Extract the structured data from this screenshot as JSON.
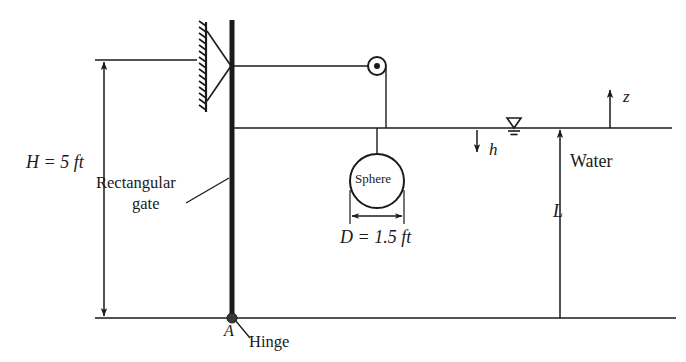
{
  "figure": {
    "background_color": "#ffffff",
    "line_color": "#1a1a1a"
  },
  "labels": {
    "height_dimension": "H = 5 ft",
    "gate_line1": "Rectangular",
    "gate_line2": "gate",
    "sphere": "Sphere",
    "diameter_dimension": "D = 1.5 ft",
    "depth_symbol": "h",
    "length_symbol": "L",
    "fluid": "Water",
    "vertical_axis": "z",
    "hinge_point": "A",
    "hinge_label": "Hinge"
  },
  "geometry": {
    "gate": {
      "x": 232,
      "y_top": 20,
      "y_bottom": 318,
      "thickness": 5
    },
    "pulley": {
      "cx": 377,
      "cy": 66,
      "radius": 9,
      "hub_radius": 3
    },
    "sphere": {
      "cx": 377,
      "cy": 181,
      "radius": 27
    },
    "water_surface_y": 128,
    "ground_y": 318,
    "top_reference_y": 60,
    "wall_support": {
      "x": 205,
      "y_top": 22,
      "y_bottom": 112
    },
    "h_arrow": {
      "x": 477,
      "y_from": 130,
      "y_to": 152
    },
    "L_arrow": {
      "x": 560,
      "y_from": 318,
      "y_to": 130
    },
    "z_arrow": {
      "x": 610,
      "y_from": 128,
      "y_to": 90
    },
    "H_arrow": {
      "x": 104,
      "y_top": 60,
      "y_bottom": 318
    },
    "D_dimension": {
      "x_from": 350,
      "x_to": 404,
      "y": 216
    }
  }
}
